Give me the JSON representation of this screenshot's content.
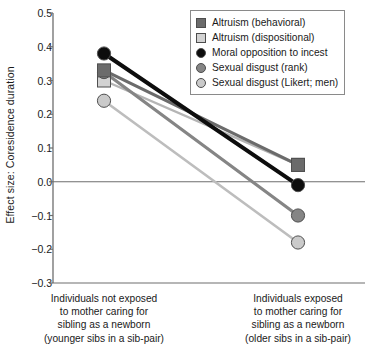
{
  "chart_data": {
    "type": "line",
    "title": "",
    "xlabel": "",
    "ylabel": "Effect size: Coresidence duration",
    "ylim": [
      -0.3,
      0.5
    ],
    "yticks": [
      0.5,
      0.4,
      0.3,
      0.2,
      0.1,
      0.0,
      -0.1,
      -0.2,
      -0.3
    ],
    "ytick_labels": [
      "0.5",
      "0.4",
      "0.3",
      "0.2",
      "0.1",
      "0.0",
      "−0.1",
      "−0.2",
      "−0.3"
    ],
    "grid": false,
    "zero_line": true,
    "legend_position": "top-right",
    "categories": [
      "Individuals not exposed to mother caring for sibling as a newborn (younger sibs in a sib-pair)",
      "Individuals exposed to mother caring for sibling as a newborn (older sibs in a sib-pair)"
    ],
    "series": [
      {
        "name": "Altruism (behavioral)",
        "values": [
          0.33,
          0.05
        ],
        "marker": "square",
        "color": "#6b6b6b",
        "line_color": "#6b6b6b"
      },
      {
        "name": "Altruism (dispositional)",
        "values": [
          0.3,
          0.05
        ],
        "marker": "square",
        "color": "#d2d2d2",
        "line_color": "#b5b5b5"
      },
      {
        "name": "Moral opposition to incest",
        "values": [
          0.38,
          -0.01
        ],
        "marker": "circle",
        "color": "#0d0d0d",
        "line_color": "#0d0d0d"
      },
      {
        "name": "Sexual disgust (rank)",
        "values": [
          0.325,
          -0.1
        ],
        "marker": "circle",
        "color": "#858585",
        "line_color": "#858585"
      },
      {
        "name": "Sexual disgust (Likert; men)",
        "values": [
          0.24,
          -0.18
        ],
        "marker": "circle",
        "color": "#cacaca",
        "line_color": "#bdbdbd"
      }
    ]
  },
  "axis": {
    "y_title": "Effect size: Coresidence duration"
  },
  "xaxis": {
    "categories": [
      {
        "lines": [
          "Individuals not exposed",
          "to mother caring for",
          "sibling as a newborn",
          "(younger sibs in a sib-pair)"
        ]
      },
      {
        "lines": [
          "Individuals exposed",
          "to mother caring for",
          "sibling as a newborn",
          "(older sibs in a sib-pair)"
        ]
      }
    ]
  },
  "legend": {
    "items": [
      {
        "label": "Altruism (behavioral)",
        "marker": "square",
        "color": "#6b6b6b"
      },
      {
        "label": "Altruism (dispositional)",
        "marker": "square",
        "color": "#d2d2d2"
      },
      {
        "label": "Moral opposition to incest",
        "marker": "circle",
        "color": "#0d0d0d"
      },
      {
        "label": "Sexual disgust (rank)",
        "marker": "circle",
        "color": "#858585"
      },
      {
        "label": "Sexual disgust (Likert; men)",
        "marker": "circle",
        "color": "#cacaca"
      }
    ]
  }
}
